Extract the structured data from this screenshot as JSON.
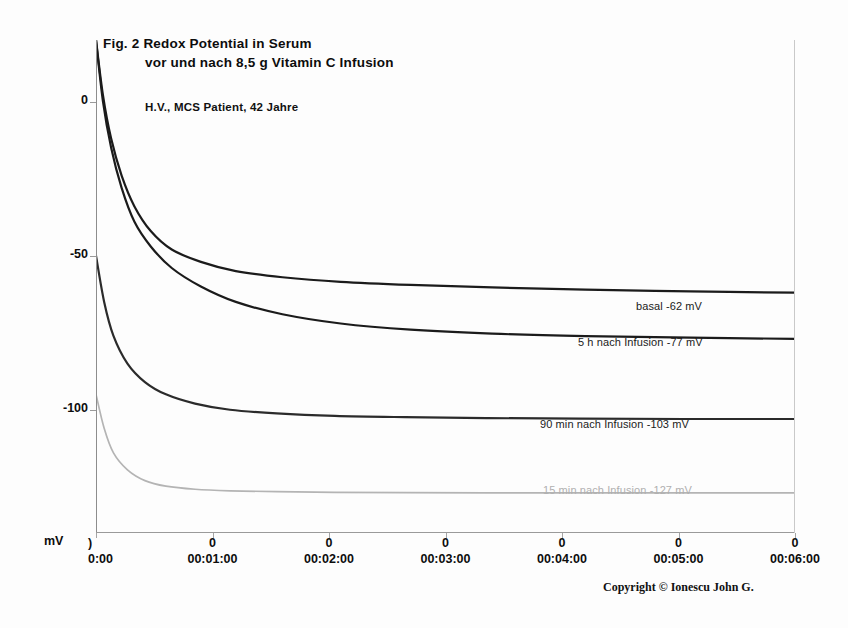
{
  "figure": {
    "title_line_1": "Fig. 2   Redox Potential in Serum",
    "title_line_2": "vor und nach 8,5 g Vitamin C Infusion",
    "subject": "H.V., MCS Patient, 42 Jahre",
    "copyright": "Copyright © Ionescu John G."
  },
  "chart_data": {
    "type": "line",
    "title": "Fig. 2   Redox Potential in Serum vor und nach 8,5 g Vitamin C Infusion",
    "subtitle": "H.V., MCS Patient, 42 Jahre",
    "xlabel": "",
    "ylabel": "mV",
    "xlim": [
      0,
      6
    ],
    "ylim": [
      -140,
      20
    ],
    "grid": false,
    "legend_position": "inline-right",
    "x_tick_labels": [
      "00:00:00",
      "00:01:00",
      "00:02:00",
      "00:03:00",
      "00:04:00",
      "00:05:00",
      "00:06:00"
    ],
    "x_tick_secondary": [
      "0",
      "0",
      "0",
      "0",
      "0",
      "0",
      "0"
    ],
    "x_tick_values": [
      0,
      1,
      2,
      3,
      4,
      5,
      6
    ],
    "y_tick_labels": [
      "0",
      "-50",
      "-100"
    ],
    "y_tick_values": [
      0,
      -50,
      -100
    ],
    "series": [
      {
        "name": "basal",
        "label": "basal  -62 mV",
        "plateau_mV": -62,
        "color": "#1b1b1b",
        "x": [
          0.0,
          0.06,
          0.13,
          0.22,
          0.33,
          0.47,
          0.65,
          0.9,
          1.2,
          1.6,
          2.1,
          2.7,
          3.4,
          4.2,
          5.1,
          6.0
        ],
        "y": [
          20,
          2,
          -12,
          -24,
          -34,
          -42,
          -48,
          -52,
          -55,
          -57,
          -58.5,
          -59.5,
          -60.3,
          -61,
          -61.6,
          -62
        ]
      },
      {
        "name": "5 h nach Infusion",
        "label": "5 h nach Infusion -77 mV",
        "plateau_mV": -77,
        "color": "#1b1b1b",
        "x": [
          0.0,
          0.06,
          0.13,
          0.22,
          0.33,
          0.47,
          0.65,
          0.9,
          1.2,
          1.6,
          2.1,
          2.7,
          3.4,
          4.2,
          5.1,
          6.0
        ],
        "y": [
          20,
          0,
          -15,
          -28,
          -39,
          -47,
          -54,
          -60,
          -65,
          -69,
          -72,
          -74,
          -75.3,
          -76.1,
          -76.6,
          -77
        ]
      },
      {
        "name": "90 min nach Infusion",
        "label": "90 min nach Infusion -103 mV",
        "plateau_mV": -103,
        "color": "#2b2b2b",
        "x": [
          0.0,
          0.07,
          0.15,
          0.27,
          0.42,
          0.6,
          0.85,
          1.15,
          1.55,
          2.05,
          2.65,
          3.35,
          4.15,
          5.05,
          6.0
        ],
        "y": [
          -50,
          -65,
          -76,
          -85,
          -91,
          -95,
          -98,
          -100,
          -101.2,
          -102,
          -102.4,
          -102.7,
          -102.9,
          -103,
          -103
        ]
      },
      {
        "name": "15 min nach Infusion",
        "label": "15 min nach Infusion -127 mV",
        "plateau_mV": -127,
        "color": "#b4b4b4",
        "x": [
          0.0,
          0.07,
          0.15,
          0.27,
          0.42,
          0.6,
          0.85,
          1.15,
          1.55,
          2.05,
          2.65,
          3.35,
          4.15,
          5.05,
          6.0
        ],
        "y": [
          -95,
          -106,
          -114,
          -119.5,
          -123,
          -124.8,
          -125.8,
          -126.3,
          -126.6,
          -126.8,
          -126.9,
          -127,
          -127,
          -127,
          -127
        ]
      }
    ],
    "annotations": [
      {
        "text": "basal  -62 mV",
        "x_px": 636,
        "y_px": 300,
        "color": "#1b1b1b"
      },
      {
        "text": "5 h nach Infusion -77 mV",
        "x_px": 578,
        "y_px": 336,
        "color": "#1b1b1b"
      },
      {
        "text": "90 min nach Infusion -103 mV",
        "x_px": 540,
        "y_px": 418,
        "color": "#1b1b1b"
      },
      {
        "text": "15 min nach Infusion -127 mV",
        "x_px": 543,
        "y_px": 484,
        "color": "#b0b0b0"
      }
    ]
  }
}
